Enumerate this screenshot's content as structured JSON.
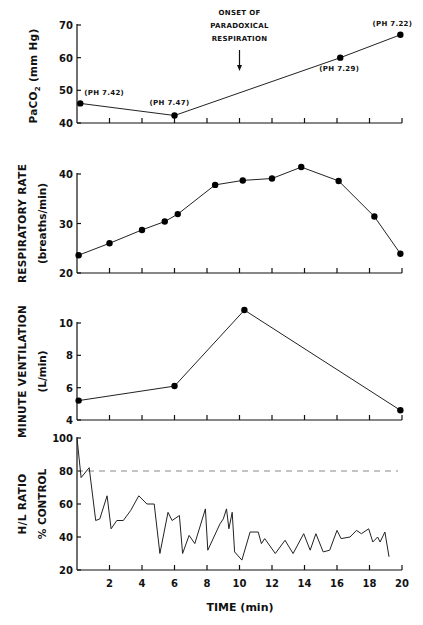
{
  "figure": {
    "xlabel": "TIME (min)",
    "x_ticks": [
      2,
      4,
      6,
      8,
      10,
      12,
      14,
      16,
      18,
      20
    ],
    "x_range": [
      0,
      20
    ]
  },
  "chart_data": [
    {
      "type": "line",
      "title": "PaCO2",
      "ylabel": "PaCO2 (mm Hg)",
      "ylabel_main": "PaCO",
      "ylabel_sub": "2",
      "ylabel_unit": "(mm Hg)",
      "ylim": [
        40,
        70
      ],
      "y_ticks": [
        40,
        50,
        60,
        70
      ],
      "xlim": [
        0,
        20
      ],
      "grid": false,
      "x": [
        0.2,
        6.0,
        16.2,
        19.9
      ],
      "values": [
        46,
        42.3,
        60,
        67
      ],
      "point_labels": [
        "(PH 7.42)",
        "(PH 7.47)",
        "(PH 7.29)",
        "(PH 7.22)"
      ],
      "annotations": [
        {
          "text": "ONSET OF",
          "x": 10
        },
        {
          "text": "PARADOXICAL",
          "x": 10
        },
        {
          "text": "RESPIRATION",
          "x": 10
        }
      ],
      "arrow_x": 10
    },
    {
      "type": "line",
      "title": "Respiratory Rate",
      "ylabel": "RESPIRATORY RATE (breaths/min)",
      "ylabel_main": "RESPIRATORY RATE",
      "ylabel_unit": "(breaths/min)",
      "ylim": [
        20,
        40
      ],
      "y_ticks": [
        20,
        30,
        40
      ],
      "xlim": [
        0,
        20
      ],
      "grid": false,
      "x": [
        0.1,
        2.0,
        4.0,
        5.4,
        6.2,
        8.5,
        10.2,
        12.0,
        13.8,
        16.1,
        18.3,
        19.9
      ],
      "values": [
        23.6,
        26,
        28.7,
        30.4,
        31.9,
        37.8,
        38.7,
        39.1,
        41.4,
        38.6,
        31.4,
        23.9
      ]
    },
    {
      "type": "line",
      "title": "Minute Ventilation",
      "ylabel": "MINUTE VENTILATION (L/min)",
      "ylabel_main": "MINUTE VENTILATION",
      "ylabel_unit": "(L/min)",
      "ylim": [
        4,
        10
      ],
      "y_ticks": [
        4,
        6,
        8,
        10
      ],
      "xlim": [
        0,
        20
      ],
      "grid": false,
      "x": [
        0.1,
        6.0,
        10.3,
        19.9
      ],
      "values": [
        5.2,
        6.1,
        10.8,
        4.6
      ]
    },
    {
      "type": "line",
      "title": "H/L Ratio % Control",
      "ylabel": "H/L RATIO % CONTROL",
      "ylabel_main": "H/L RATIO",
      "ylabel_unit": "% CONTROL",
      "ylim": [
        20,
        100
      ],
      "y_ticks": [
        20,
        40,
        60,
        80,
        100
      ],
      "xlim": [
        0,
        20
      ],
      "xlabel": "TIME (min)",
      "x_ticks": [
        2,
        4,
        6,
        8,
        10,
        12,
        14,
        16,
        18,
        20
      ],
      "grid": false,
      "reference_line": {
        "y": 80,
        "style": "dashed"
      },
      "x": [
        0,
        0.25,
        0.75,
        1.15,
        1.4,
        1.85,
        2.1,
        2.45,
        2.85,
        3.3,
        3.8,
        4.3,
        4.75,
        5.1,
        5.6,
        5.85,
        6.3,
        6.5,
        6.9,
        7.25,
        7.9,
        8.05,
        8.8,
        9.0,
        9.2,
        9.35,
        9.55,
        9.7,
        10.15,
        10.65,
        11.15,
        11.35,
        11.55,
        12.2,
        12.8,
        13.3,
        13.95,
        14.35,
        14.7,
        15.15,
        15.55,
        16.0,
        16.25,
        16.8,
        17.2,
        17.5,
        17.95,
        18.2,
        18.5,
        18.65,
        18.95,
        19.2
      ],
      "values": [
        100,
        76,
        82,
        50,
        51,
        65,
        45,
        50,
        50,
        56,
        65,
        60,
        60,
        30,
        55,
        50,
        53,
        30,
        41,
        36,
        57,
        32,
        48,
        51,
        57,
        45,
        55,
        31,
        26,
        43,
        43,
        36,
        39,
        30,
        38,
        30,
        42,
        32,
        42,
        31,
        32,
        44,
        39,
        40,
        44,
        42,
        45,
        37,
        40,
        37,
        43,
        28
      ]
    }
  ]
}
